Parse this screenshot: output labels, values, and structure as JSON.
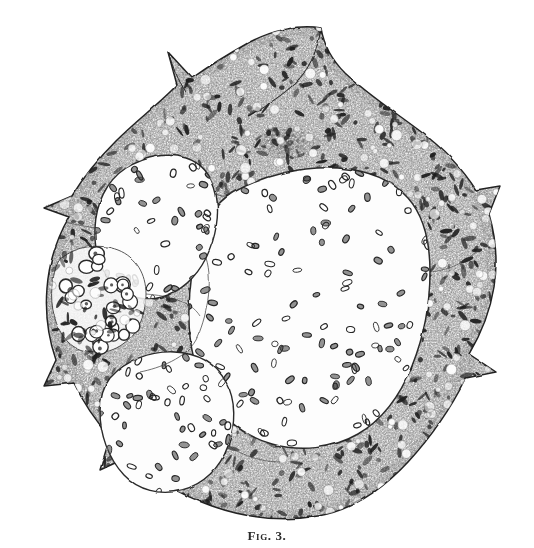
{
  "plate": {
    "caption": "Fig. 3.",
    "background_color": "#ffffff",
    "ink_color": "#2b2b2b",
    "mid_tone_color": "#6e6e6e",
    "light_tone_color": "#b9b9b9",
    "width": 534,
    "height": 548
  },
  "figure": {
    "title": "Fig. 3.",
    "technique": "engraving / lithograph stipple",
    "outline_description": "irregular polygonal body with pointed spurs at top-centre, top-left, left, lower-left, right and lower-right",
    "regions": [
      {
        "id": "capsule-stroma",
        "label": "stippled stroma / capsule",
        "tone": "dark stipple",
        "ink_color": "#3a3a3a"
      },
      {
        "id": "central-lumen",
        "label": "large central clear space with scattered oval nuclei",
        "tone": "clear",
        "cell_count": 150,
        "cell_shape": "oval"
      },
      {
        "id": "upper-left-lobule",
        "label": "upper-left lobule / alveolus",
        "tone": "clear",
        "cell_count": 52,
        "cell_shape": "oval"
      },
      {
        "id": "lower-left-lobule",
        "label": "lower-left lobule / alveolus",
        "tone": "clear",
        "cell_count": 60,
        "cell_shape": "oval"
      },
      {
        "id": "left-cell-cluster",
        "label": "cluster of large ring-shaped cells at left margin",
        "tone": "outlined rings",
        "cell_count": 26,
        "cell_shape": "ring"
      },
      {
        "id": "upper-dark-aggregate",
        "label": "dark nuclear aggregate at upper centre",
        "tone": "dense dark stipple"
      }
    ]
  }
}
